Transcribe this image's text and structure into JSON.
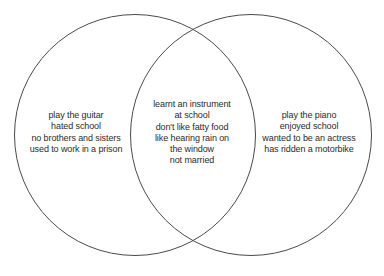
{
  "diagram": {
    "type": "venn",
    "title": "",
    "background_color": "#ffffff",
    "stroke_color": "#4a4a4a",
    "text_color": "#2b2b2b",
    "sets": {
      "left": {
        "label": "",
        "lines": [
          "play the guitar",
          "hated school",
          "no brothers and sisters",
          "used to work in a prison"
        ]
      },
      "intersection": {
        "label": "",
        "lines": [
          "learnt an instrument",
          "at school",
          "don't like fatty food",
          "like hearing rain on",
          "the window",
          "not married"
        ]
      },
      "right": {
        "label": "",
        "lines": [
          "play the piano",
          "enjoyed school",
          "wanted to be an actress",
          "has ridden a motorbike"
        ]
      }
    }
  }
}
